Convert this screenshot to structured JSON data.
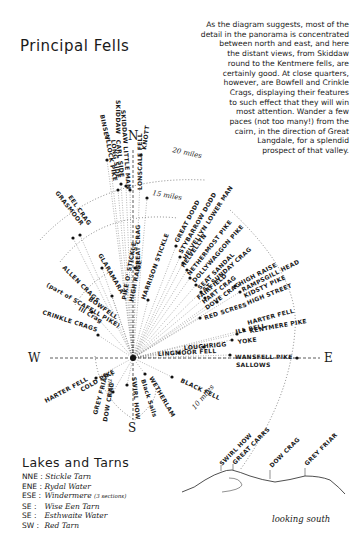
{
  "title": "Principal Fells",
  "paragraph": [
    "As the diagram suggests, most of the",
    "detail in the panorama is concentrated",
    "between north and east, and here",
    "the distant views, from Skiddaw",
    "round to the Kentmere fells, are",
    "certainly good. At close quarters,",
    "however, are Bowfell and Crinkle",
    "Crags, displaying their features",
    "to such effect that they will win",
    "most attention.  Wander a few",
    "paces (not too many!) from the",
    "cairn, in the direction of Great",
    "Langdale, for a splendid",
    "prospect of that valley."
  ],
  "compass": {
    "n": "N",
    "e": "E",
    "s": "S",
    "w": "W"
  },
  "distances": {
    "d20": "20 miles",
    "d15": "15 miles",
    "d10": "10 miles",
    "d5": "5 miles"
  },
  "fells": {
    "skiddaw": "SKIDDAW",
    "binsey": "BINSEY",
    "ullock_pike": "ULLOCK PIKE",
    "long_side": "LONG SIDE",
    "carl_side": "CARL SIDE",
    "skiddaw_little_man": "SKIDDAW LITTLE MAN",
    "lonscale_fell": "LONSCALE FELL",
    "knott": "KNOTT",
    "great_crag": "GREAT CRAG",
    "great_dodd": "GREAT DODD",
    "stybarrow_dodd": "STYBARROW DODD",
    "helvellyn_lower_man": "HELVELLYN LOWER MAN",
    "helvellyn": "HELVELLYN",
    "nethermost_pike": "NETHERMOST PIKE",
    "dollywaggon_pike": "DOLLYWAGGON PIKE",
    "st_sunday_crag": "ST SUNDAY CRAG",
    "fairfield": "FAIRFIELD",
    "hart_crag": "HART CRAG",
    "dove_crag": "DOVE CRAG",
    "seat_sandal": "SEAT SANDAL",
    "high_raise_h": "HIGH RAISE",
    "rampsgill_head": "RAMPSGILL HEAD",
    "kidsty_pike": "KIDSTY PIKE",
    "high_street": "HIGH STREET",
    "harter_fell_e": "HARTER FELL",
    "ill_bell": "ILL BELL",
    "kentmere_pike": "KENTMERE PIKE",
    "yoke": "YOKE",
    "red_screes": "RED SCREES",
    "loughrigg": "LOUGHRIGG",
    "lingmoor_fell": "LINGMOOR FELL",
    "wansfell_pike": "WANSFELL PIKE",
    "sallows": "SALLOWS",
    "black_fell": "BLACK FELL",
    "wetherlam": "WETHERLAM",
    "black_sails": "Black Sails",
    "swirl_how": "SWIRL HOW",
    "dow_crag": "DOW CRAG",
    "grey_friar": "GREY FRIAR",
    "cold_pike": "COLD PIKE",
    "harter_fell_w": "HARTER FELL",
    "crinkle_crags": "CRINKLE CRAGS",
    "ill_crag": "Ill Crag",
    "bowfell": "BOWFELL",
    "scafell_pike_note": "(part of SCAFELL PIKE)",
    "allen_crags": "ALLEN CRAGS",
    "glaramara": "GLARAMARA",
    "eel_crag": "EEL CRAG",
    "grasmoor": "GRASMOOR",
    "pike_o_stickle": "PIKE O' STICKLE",
    "high_raise": "HIGH RAISE",
    "harrison_stickle": "HARRISON STICKLE"
  },
  "lakes": {
    "title": "Lakes and Tarns",
    "items": [
      {
        "dir": "NNE :",
        "name": "Stickle Tarn",
        "note": ""
      },
      {
        "dir": "ENE :",
        "name": "Rydal Water",
        "note": ""
      },
      {
        "dir": "ESE :",
        "name": "Windermere",
        "note": "(3 sections)"
      },
      {
        "dir": "SE :",
        "name": "Wise Een Tarn",
        "note": ""
      },
      {
        "dir": "SE :",
        "name": "Esthwaite Water",
        "note": ""
      },
      {
        "dir": "SW :",
        "name": "Red Tarn",
        "note": ""
      }
    ]
  },
  "profile": {
    "labels": {
      "swirl_how": "SWIRL HOW",
      "great_carrs": "GREAT CARRS",
      "dow_crag": "DOW CRAG",
      "grey_friar": "GREY FRIAR"
    },
    "caption": "looking south"
  }
}
